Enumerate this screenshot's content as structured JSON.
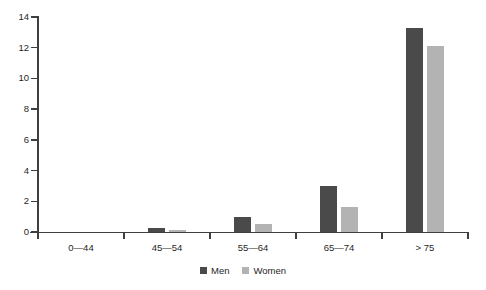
{
  "chart_data": {
    "type": "bar",
    "title": "",
    "subtitle": "",
    "xlabel": "",
    "ylabel": "",
    "categories": [
      "0—44",
      "45—54",
      "55—64",
      "65—74",
      "> 75"
    ],
    "series": [
      {
        "name": "Men",
        "color": "#4a4a4a",
        "values": [
          0,
          0.25,
          1.0,
          3.0,
          13.3
        ]
      },
      {
        "name": "Women",
        "color": "#b3b3b3",
        "values": [
          0,
          0.1,
          0.55,
          1.6,
          12.1
        ]
      }
    ],
    "ylim": [
      0,
      14
    ],
    "yticks": [
      0,
      2,
      4,
      6,
      8,
      10,
      12,
      14
    ],
    "ytick_labels": [
      "0",
      "2",
      "4",
      "6",
      "8",
      "10",
      "12",
      "14"
    ],
    "grid": false,
    "legend_position": "bottom-center",
    "legend_entries": [
      "Men",
      "Women"
    ],
    "axis_color": "#3f3f3f",
    "background": "#ffffff"
  }
}
